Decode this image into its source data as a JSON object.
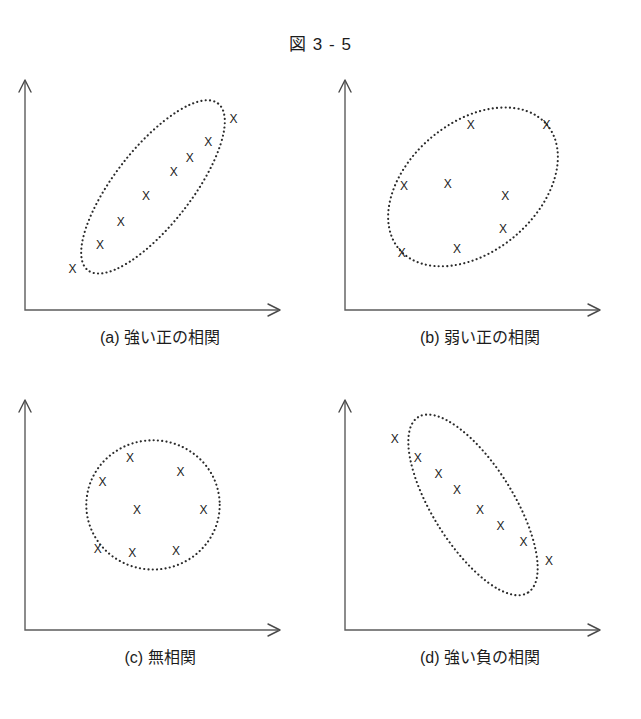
{
  "figure": {
    "title": "図 3 - 5",
    "background_color": "#ffffff",
    "ink_color": "#232323",
    "axis_color": "#5c5c5c"
  },
  "panels": [
    {
      "id": "a",
      "caption": "(a) 強い正の相関",
      "marker_glyph": "X"
    },
    {
      "id": "b",
      "caption": "(b) 弱い正の相関",
      "marker_glyph": "X"
    },
    {
      "id": "c",
      "caption": "(c) 無相関",
      "marker_glyph": "X"
    },
    {
      "id": "d",
      "caption": "(d) 強い負の相関",
      "marker_glyph": "X"
    }
  ],
  "chart_data": [
    {
      "type": "scatter",
      "title": "(a) 強い正の相関",
      "subtitle": "strong positive correlation",
      "xlabel": "",
      "ylabel": "",
      "xlim": [
        0,
        10
      ],
      "ylim": [
        0,
        10
      ],
      "grid": false,
      "legend": "none",
      "marker": "x",
      "annotations": [
        "dotted ellipse envelope, tilted about +52 degrees"
      ],
      "envelope": {
        "shape": "ellipse",
        "cx": 5.0,
        "cy": 5.4,
        "rx": 4.6,
        "ry": 1.9,
        "rotation_deg": -52
      },
      "points": [
        {
          "x": 1.5,
          "y": 1.3
        },
        {
          "x": 2.7,
          "y": 2.5
        },
        {
          "x": 3.6,
          "y": 3.6
        },
        {
          "x": 4.7,
          "y": 4.9
        },
        {
          "x": 5.9,
          "y": 6.1
        },
        {
          "x": 6.6,
          "y": 6.8
        },
        {
          "x": 7.4,
          "y": 7.6
        },
        {
          "x": 8.5,
          "y": 8.7
        }
      ]
    },
    {
      "type": "scatter",
      "title": "(b) 弱い正の相関",
      "subtitle": "weak positive correlation",
      "xlabel": "",
      "ylabel": "",
      "xlim": [
        0,
        10
      ],
      "ylim": [
        0,
        10
      ],
      "grid": false,
      "legend": "none",
      "marker": "x",
      "annotations": [
        "dotted ellipse envelope, broad, tilted about +40 degrees"
      ],
      "envelope": {
        "shape": "ellipse",
        "cx": 5.0,
        "cy": 5.4,
        "rx": 4.2,
        "ry": 3.2,
        "rotation_deg": -40
      },
      "points": [
        {
          "x": 1.9,
          "y": 2.1
        },
        {
          "x": 2.0,
          "y": 5.4
        },
        {
          "x": 3.9,
          "y": 5.5
        },
        {
          "x": 4.3,
          "y": 2.3
        },
        {
          "x": 4.9,
          "y": 8.4
        },
        {
          "x": 6.4,
          "y": 4.9
        },
        {
          "x": 6.3,
          "y": 3.3
        },
        {
          "x": 8.2,
          "y": 8.4
        }
      ]
    },
    {
      "type": "scatter",
      "title": "(c) 無相関",
      "subtitle": "no correlation",
      "xlabel": "",
      "ylabel": "",
      "xlim": [
        0,
        10
      ],
      "ylim": [
        0,
        10
      ],
      "grid": false,
      "legend": "none",
      "marker": "x",
      "annotations": [
        "dotted near-circular envelope"
      ],
      "envelope": {
        "shape": "ellipse",
        "cx": 5.0,
        "cy": 5.5,
        "rx": 2.9,
        "ry": 3.2,
        "rotation_deg": 0
      },
      "points": [
        {
          "x": 2.8,
          "y": 6.6
        },
        {
          "x": 2.6,
          "y": 3.3
        },
        {
          "x": 4.0,
          "y": 7.8
        },
        {
          "x": 4.3,
          "y": 5.2
        },
        {
          "x": 4.1,
          "y": 3.1
        },
        {
          "x": 6.2,
          "y": 7.1
        },
        {
          "x": 6.0,
          "y": 3.2
        },
        {
          "x": 7.2,
          "y": 5.2
        }
      ]
    },
    {
      "type": "scatter",
      "title": "(d) 強い負の相関",
      "subtitle": "strong negative correlation",
      "xlabel": "",
      "ylabel": "",
      "xlim": [
        0,
        10
      ],
      "ylim": [
        0,
        10
      ],
      "grid": false,
      "legend": "none",
      "marker": "x",
      "annotations": [
        "dotted ellipse envelope, tilted about -60 degrees"
      ],
      "envelope": {
        "shape": "ellipse",
        "cx": 5.0,
        "cy": 5.5,
        "rx": 4.5,
        "ry": 2.0,
        "rotation_deg": 58
      },
      "points": [
        {
          "x": 1.6,
          "y": 8.7
        },
        {
          "x": 2.6,
          "y": 7.8
        },
        {
          "x": 3.5,
          "y": 7.0
        },
        {
          "x": 4.3,
          "y": 6.2
        },
        {
          "x": 5.3,
          "y": 5.2
        },
        {
          "x": 6.2,
          "y": 4.4
        },
        {
          "x": 7.2,
          "y": 3.6
        },
        {
          "x": 8.3,
          "y": 2.7
        }
      ]
    }
  ]
}
